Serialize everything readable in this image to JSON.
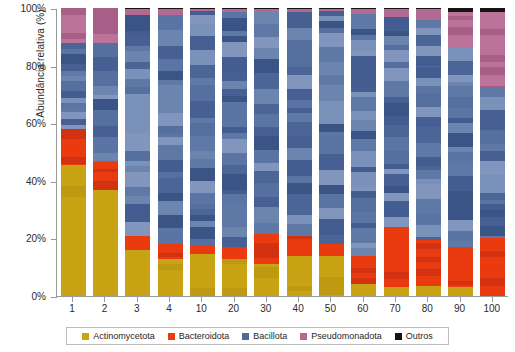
{
  "chart_data": {
    "type": "bar",
    "subtype": "stacked-percent",
    "title": "",
    "xlabel": "",
    "ylabel": "Abundância relativa (%)",
    "ylim": [
      0,
      100
    ],
    "yticks": [
      "0%",
      "20%",
      "40%",
      "60%",
      "80%",
      "100%"
    ],
    "ytick_values": [
      0,
      20,
      40,
      60,
      80,
      100
    ],
    "grid": false,
    "legend_position": "bottom",
    "categories": [
      "1",
      "2",
      "3",
      "4",
      "10",
      "20",
      "30",
      "40",
      "50",
      "60",
      "70",
      "80",
      "90",
      "100"
    ],
    "series": [
      {
        "name": "Actinomycetota",
        "color": "#c8a313",
        "values": [
          45.5,
          37.0,
          16.0,
          13.0,
          14.5,
          13.0,
          11.0,
          14.0,
          14.0,
          4.0,
          3.0,
          3.5,
          3.0,
          0.0
        ]
      },
      {
        "name": "Bacteroidota",
        "color": "#ea3a10",
        "values": [
          12.5,
          9.5,
          5.0,
          5.0,
          3.0,
          4.0,
          10.5,
          7.0,
          4.0,
          10.0,
          21.0,
          16.0,
          14.0,
          20.0
        ]
      },
      {
        "name": "Bacillota",
        "color": "#51689e",
        "values": [
          30.0,
          41.5,
          76.5,
          79.5,
          81.5,
          81.5,
          77.0,
          77.5,
          81.0,
          84.0,
          73.0,
          76.5,
          69.0,
          53.0
        ]
      },
      {
        "name": "Pseudomonadota",
        "color": "#b36a92",
        "values": [
          12.0,
          12.0,
          2.3,
          2.3,
          0.8,
          1.3,
          1.3,
          1.3,
          0.8,
          1.8,
          2.8,
          3.8,
          12.5,
          25.5
        ]
      },
      {
        "name": "Outros",
        "color": "#151515",
        "values": [
          0.0,
          0.0,
          0.2,
          0.2,
          0.2,
          0.2,
          0.2,
          0.2,
          0.2,
          0.2,
          0.2,
          0.2,
          1.5,
          1.5
        ]
      }
    ]
  },
  "legend": {
    "items": [
      {
        "label": "Actinomycetota",
        "color": "#c8a313"
      },
      {
        "label": "Bacteroidota",
        "color": "#ea3a10"
      },
      {
        "label": "Bacillota",
        "color": "#51689e"
      },
      {
        "label": "Pseudomonadota",
        "color": "#b36a92"
      },
      {
        "label": "Outros",
        "color": "#151515"
      }
    ]
  },
  "axes": {
    "y_title": "Abundância relativa (%)"
  }
}
